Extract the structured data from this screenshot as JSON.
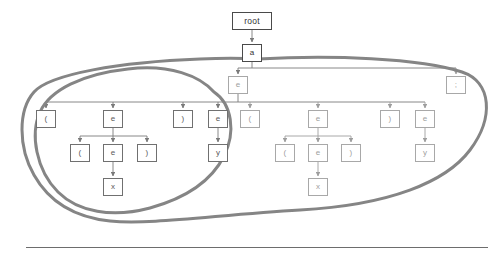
{
  "diagram": {
    "type": "tree",
    "colors": {
      "node_border": "#707070",
      "node_border_faint": "#a8a8a8",
      "edge": "#7a7a7a",
      "highlight_curve": "#808080",
      "text": "#5a5a5a",
      "background": "#ffffff",
      "rule": "#6d6d6d"
    },
    "nodes": [
      {
        "id": "root",
        "label": "root",
        "x": 232,
        "y": 12,
        "w": 40,
        "h": 18,
        "style": "strong"
      },
      {
        "id": "a",
        "label": "a",
        "x": 242,
        "y": 44,
        "w": 20,
        "h": 18,
        "style": "strong"
      },
      {
        "id": "e0",
        "label": "e",
        "x": 228,
        "y": 76,
        "w": 20,
        "h": 18,
        "style": "faint"
      },
      {
        "id": "semi",
        "label": ";",
        "x": 446,
        "y": 76,
        "w": 20,
        "h": 18,
        "style": "faint"
      },
      {
        "id": "l1",
        "label": "(",
        "x": 36,
        "y": 110,
        "w": 20,
        "h": 18,
        "style": "normal"
      },
      {
        "id": "e1",
        "label": "e",
        "x": 103,
        "y": 110,
        "w": 20,
        "h": 18,
        "style": "normal"
      },
      {
        "id": "r1",
        "label": ")",
        "x": 173,
        "y": 110,
        "w": 20,
        "h": 18,
        "style": "normal"
      },
      {
        "id": "e2",
        "label": "e",
        "x": 208,
        "y": 110,
        "w": 20,
        "h": 18,
        "style": "normal"
      },
      {
        "id": "l2",
        "label": "(",
        "x": 240,
        "y": 110,
        "w": 20,
        "h": 18,
        "style": "faint"
      },
      {
        "id": "e3",
        "label": "e",
        "x": 308,
        "y": 110,
        "w": 20,
        "h": 18,
        "style": "faint"
      },
      {
        "id": "r2",
        "label": ")",
        "x": 380,
        "y": 110,
        "w": 20,
        "h": 18,
        "style": "faint"
      },
      {
        "id": "e4",
        "label": "e",
        "x": 415,
        "y": 110,
        "w": 20,
        "h": 18,
        "style": "faint"
      },
      {
        "id": "l3",
        "label": "(",
        "x": 70,
        "y": 144,
        "w": 20,
        "h": 18,
        "style": "normal"
      },
      {
        "id": "e5",
        "label": "e",
        "x": 103,
        "y": 144,
        "w": 20,
        "h": 18,
        "style": "normal"
      },
      {
        "id": "r3",
        "label": ")",
        "x": 137,
        "y": 144,
        "w": 20,
        "h": 18,
        "style": "normal"
      },
      {
        "id": "y1",
        "label": "y",
        "x": 208,
        "y": 144,
        "w": 20,
        "h": 18,
        "style": "normal"
      },
      {
        "id": "l4",
        "label": "(",
        "x": 275,
        "y": 144,
        "w": 20,
        "h": 18,
        "style": "faint"
      },
      {
        "id": "e6",
        "label": "e",
        "x": 308,
        "y": 144,
        "w": 20,
        "h": 18,
        "style": "faint"
      },
      {
        "id": "r4",
        "label": ")",
        "x": 341,
        "y": 144,
        "w": 20,
        "h": 18,
        "style": "faint"
      },
      {
        "id": "y2",
        "label": "y",
        "x": 415,
        "y": 144,
        "w": 20,
        "h": 18,
        "style": "faint"
      },
      {
        "id": "x1",
        "label": "x",
        "x": 103,
        "y": 178,
        "w": 20,
        "h": 18,
        "style": "normal"
      },
      {
        "id": "x2",
        "label": "x",
        "x": 308,
        "y": 178,
        "w": 20,
        "h": 18,
        "style": "faint"
      }
    ],
    "edges": [
      {
        "from": "root",
        "to": "a"
      },
      {
        "from": "a",
        "to": "e0"
      },
      {
        "from": "a",
        "to": "semi"
      },
      {
        "from": "e0",
        "to": "l1"
      },
      {
        "from": "e0",
        "to": "e1"
      },
      {
        "from": "e0",
        "to": "r1"
      },
      {
        "from": "e0",
        "to": "e2"
      },
      {
        "from": "e0",
        "to": "l2"
      },
      {
        "from": "e0",
        "to": "e3"
      },
      {
        "from": "e0",
        "to": "r2"
      },
      {
        "from": "e0",
        "to": "e4"
      },
      {
        "from": "e1",
        "to": "l3"
      },
      {
        "from": "e1",
        "to": "e5"
      },
      {
        "from": "e1",
        "to": "r3"
      },
      {
        "from": "e2",
        "to": "y1"
      },
      {
        "from": "e3",
        "to": "l4"
      },
      {
        "from": "e3",
        "to": "e6"
      },
      {
        "from": "e3",
        "to": "r4"
      },
      {
        "from": "e4",
        "to": "y2"
      },
      {
        "from": "e5",
        "to": "x1"
      },
      {
        "from": "e6",
        "to": "x2"
      }
    ],
    "highlights": [
      {
        "id": "outer-region",
        "label": "outer-highlight-loop"
      },
      {
        "id": "inner-region",
        "label": "inner-highlight-loop"
      }
    ]
  }
}
